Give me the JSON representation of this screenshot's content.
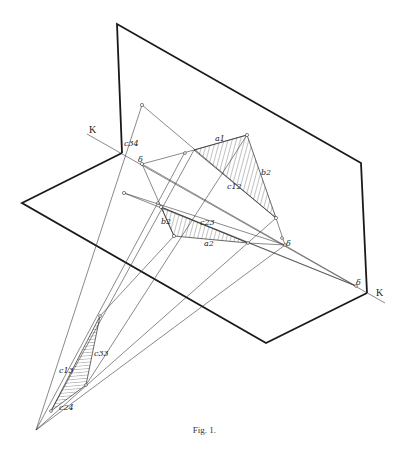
{
  "figure": {
    "caption": "Fig. 1.",
    "axis_label_left": "K",
    "axis_label_right": "K",
    "labels": {
      "c34": "c34",
      "delta_upper": "δ",
      "a1": "a1",
      "b2_upper": "b2",
      "c12": "c12",
      "b2_lower": "b2",
      "c23": "c23",
      "a2": "a2",
      "delta_mid": "δ",
      "delta_right": "δ",
      "c13": "c13",
      "c33": "c33",
      "c24": "c24"
    },
    "colors": {
      "stroke": "#1a1a1a",
      "hatch": "#3a3a3a",
      "background": "#ffffff"
    }
  }
}
